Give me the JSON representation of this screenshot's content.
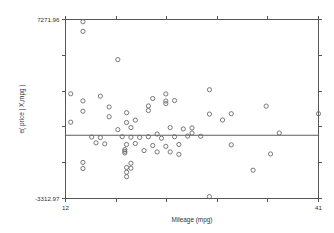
{
  "chart_data": {
    "type": "scatter",
    "title": "",
    "subtitle": "",
    "xlabel": "Mileage (mpg)",
    "ylabel": "e( price | X,mpg )",
    "grid": false,
    "legend": null,
    "xlim": [
      12,
      41
    ],
    "ylim": [
      -3312.97,
      7271.96
    ],
    "x_ticklabels": [
      "12",
      "41"
    ],
    "y_ticklabels": [
      "7271.96",
      "-3312.97"
    ],
    "x_tick_values": [
      12,
      41
    ],
    "y_tick_values": [
      7271.96,
      -3312.97
    ],
    "frame": "box",
    "tick_direction": "out",
    "marker": "open-circle",
    "series": [
      {
        "name": "residuals",
        "points": [
          [
            14.0,
            7140
          ],
          [
            14.0,
            6570
          ],
          [
            18.0,
            4900
          ],
          [
            12.6,
            2880
          ],
          [
            14.0,
            2460
          ],
          [
            16.0,
            2740
          ],
          [
            14.0,
            1850
          ],
          [
            17.0,
            2100
          ],
          [
            17.0,
            1520
          ],
          [
            19.0,
            1760
          ],
          [
            20.0,
            1320
          ],
          [
            12.6,
            1200
          ],
          [
            22.0,
            2600
          ],
          [
            23.5,
            2870
          ],
          [
            23.5,
            2450
          ],
          [
            23.5,
            2300
          ],
          [
            24.5,
            2480
          ],
          [
            21.5,
            2160
          ],
          [
            21.5,
            1890
          ],
          [
            28.5,
            3120
          ],
          [
            28.5,
            1680
          ],
          [
            30.0,
            1330
          ],
          [
            31.0,
            1700
          ],
          [
            35.0,
            2150
          ],
          [
            41.0,
            1700
          ],
          [
            19.0,
            1180
          ],
          [
            19.5,
            880
          ],
          [
            24.0,
            880
          ],
          [
            25.5,
            800
          ],
          [
            26.5,
            860
          ],
          [
            18.0,
            760
          ],
          [
            22.5,
            500
          ],
          [
            26.5,
            560
          ],
          [
            36.5,
            560
          ],
          [
            15.0,
            320
          ],
          [
            16.0,
            290
          ],
          [
            18.5,
            340
          ],
          [
            19.5,
            310
          ],
          [
            20.5,
            300
          ],
          [
            21.5,
            340
          ],
          [
            23.0,
            250
          ],
          [
            24.5,
            340
          ],
          [
            26.0,
            380
          ],
          [
            27.5,
            370
          ],
          [
            15.5,
            -20
          ],
          [
            16.5,
            -80
          ],
          [
            19.0,
            -120
          ],
          [
            20.0,
            -60
          ],
          [
            22.0,
            -180
          ],
          [
            23.5,
            -230
          ],
          [
            25.0,
            -120
          ],
          [
            31.0,
            -140
          ],
          [
            18.8,
            -420
          ],
          [
            18.8,
            -520
          ],
          [
            18.8,
            -620
          ],
          [
            21.0,
            -480
          ],
          [
            22.5,
            -560
          ],
          [
            24.0,
            -560
          ],
          [
            25.0,
            -700
          ],
          [
            14.0,
            -1180
          ],
          [
            14.0,
            -1540
          ],
          [
            19.5,
            -1230
          ],
          [
            19.5,
            -1520
          ],
          [
            19.0,
            -1480
          ],
          [
            19.0,
            -1760
          ],
          [
            19.0,
            -2020
          ],
          [
            33.5,
            -1640
          ],
          [
            35.5,
            -680
          ],
          [
            28.5,
            -3200
          ]
        ]
      }
    ],
    "fit_line": {
      "name": "reference-line",
      "y": 430,
      "x_start": 12,
      "x_end": 41
    }
  }
}
